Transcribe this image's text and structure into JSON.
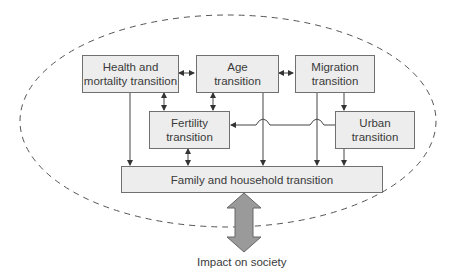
{
  "diagram": {
    "boundary": "dashed-ellipse",
    "nodes": [
      {
        "id": "health",
        "label": "Health and mortality transition",
        "line1": "Health and",
        "line2": "mortality transition"
      },
      {
        "id": "age",
        "label": "Age transition",
        "line1": "Age",
        "line2": "transition"
      },
      {
        "id": "migration",
        "label": "Migration transition",
        "line1": "Migration",
        "line2": "transition"
      },
      {
        "id": "fertility",
        "label": "Fertility transition",
        "line1": "Fertility",
        "line2": "transition"
      },
      {
        "id": "urban",
        "label": "Urban transition",
        "line1": "Urban",
        "line2": "transition"
      },
      {
        "id": "family",
        "label": "Family and household transition"
      }
    ],
    "edges": [
      {
        "from": "health",
        "to": "age",
        "type": "bidirectional"
      },
      {
        "from": "age",
        "to": "migration",
        "type": "bidirectional"
      },
      {
        "from": "health",
        "to": "fertility",
        "type": "bidirectional"
      },
      {
        "from": "age",
        "to": "fertility",
        "type": "bidirectional"
      },
      {
        "from": "migration",
        "to": "urban",
        "type": "directed"
      },
      {
        "from": "urban",
        "to": "fertility",
        "type": "directed"
      },
      {
        "from": "health",
        "to": "family",
        "type": "directed"
      },
      {
        "from": "fertility",
        "to": "family",
        "type": "bidirectional"
      },
      {
        "from": "age",
        "to": "family",
        "type": "directed"
      },
      {
        "from": "migration",
        "to": "family",
        "type": "directed"
      },
      {
        "from": "urban",
        "to": "family",
        "type": "directed"
      },
      {
        "from": "family",
        "to": "society",
        "type": "bidirectional-block"
      }
    ],
    "output_label": "Impact on society",
    "colors": {
      "box_fill": "#ededed",
      "box_border": "#707070",
      "line": "#444444",
      "big_arrow_fill": "#9a9a9a"
    }
  }
}
